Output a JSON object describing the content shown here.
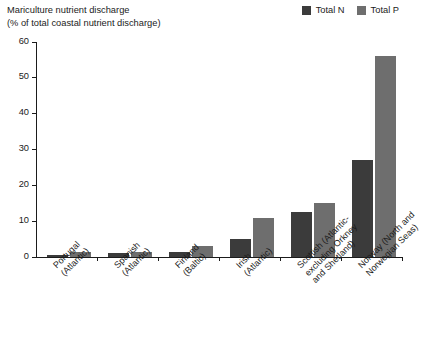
{
  "title": {
    "line1": "Mariculture nutrient discharge",
    "line2": "(% of total coastal nutrient discharge)"
  },
  "legend": {
    "position": "top-right",
    "items": [
      {
        "label": "Total N",
        "color": "#3b3b3b",
        "icon": "legend-swatch-total-n"
      },
      {
        "label": "Total P",
        "color": "#6e6e6e",
        "icon": "legend-swatch-total-p"
      }
    ]
  },
  "chart_data": {
    "type": "bar",
    "title": "Mariculture nutrient discharge (% of total coastal nutrient discharge)",
    "xlabel": "",
    "ylabel": "% of total coastal nutrient discharge",
    "ylim": [
      0,
      60
    ],
    "yticks": [
      0,
      10,
      20,
      30,
      40,
      50,
      60
    ],
    "grid": false,
    "legend_position": "top-right",
    "categories": [
      "Portugal (Atlantic)",
      "Spanish (Atlantic)",
      "Finland (Baltic)",
      "Irish (Atlantic)",
      "Scottish (Atlantic- excluding Orkney and Shetland)",
      "Norway (North and Norwegian Seas)"
    ],
    "category_lines": [
      [
        "Portugal",
        "(Atlantic)"
      ],
      [
        "Spanish",
        "(Atlantic)"
      ],
      [
        "Finland",
        "(Baltic)"
      ],
      [
        "Irish",
        "(Atlantic)"
      ],
      [
        "Scottish (Atlantic-",
        "excluding Orkney",
        "and Shetland)"
      ],
      [
        "Norway (North and",
        "Norwegian Seas)"
      ]
    ],
    "series": [
      {
        "name": "Total N",
        "color": "#3b3b3b",
        "values": [
          0.5,
          1.2,
          1.3,
          5.0,
          12.5,
          27.0
        ]
      },
      {
        "name": "Total P",
        "color": "#6e6e6e",
        "values": [
          1.5,
          1.5,
          3.0,
          11.0,
          15.0,
          56.0
        ]
      }
    ]
  }
}
